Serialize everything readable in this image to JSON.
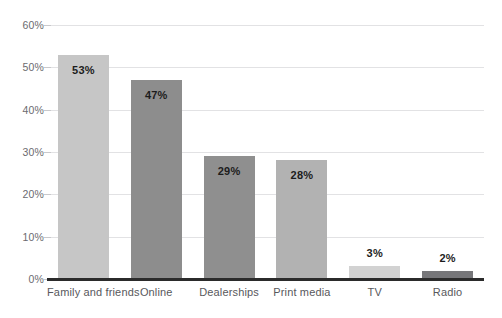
{
  "chart_data": {
    "type": "bar",
    "title": "",
    "subtitle": "",
    "xlabel": "",
    "ylabel": "",
    "categories": [
      "Family and friends",
      "Online",
      "Dealerships",
      "Print media",
      "TV",
      "Radio"
    ],
    "values": [
      53,
      47,
      29,
      28,
      3,
      2
    ],
    "data_labels": [
      "53%",
      "47%",
      "29%",
      "28%",
      "3%",
      "2%"
    ],
    "bar_colors": [
      "#c6c6c6",
      "#8d8d8d",
      "#8f8f8f",
      "#b2b2b2",
      "#d2d2d2",
      "#77777a"
    ],
    "label_position": [
      "inside",
      "inside",
      "inside",
      "inside",
      "outside",
      "outside"
    ],
    "ylim": [
      0,
      60
    ],
    "ytick_values": [
      0,
      10,
      20,
      30,
      40,
      50,
      60
    ],
    "ytick_labels": [
      "0%",
      "10%",
      "20%",
      "30%",
      "40%",
      "50%",
      "60%"
    ],
    "grid": true,
    "grid_color": "#e2e2e4",
    "legend": false,
    "legend_position": "none",
    "axis_color": "#2b2b2b",
    "tick_label_color": "#6b6b6f",
    "value_label_color": "#1c1c1c",
    "background": "#ffffff"
  }
}
